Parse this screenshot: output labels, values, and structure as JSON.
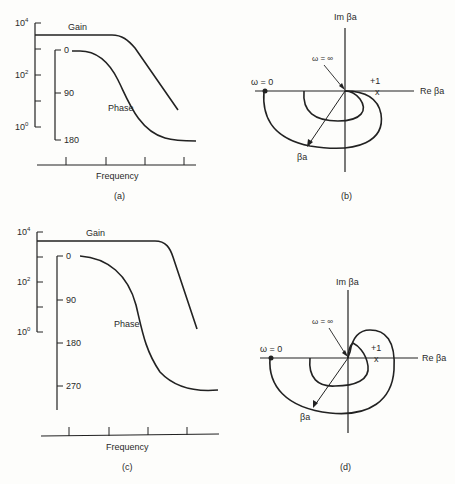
{
  "panels": [
    {
      "id": "a",
      "caption": "(a)",
      "type": "bode",
      "gain_axis": {
        "ticks": [
          "10^4",
          "10^2",
          "10^0"
        ],
        "base": "10",
        "exps": [
          "4",
          "2",
          "0"
        ]
      },
      "phase_axis": {
        "ticks": [
          "0",
          "90",
          "180"
        ]
      },
      "gain_label": "Gain",
      "phase_label": "Phase",
      "xlabel": "Frequency"
    },
    {
      "id": "b",
      "caption": "(b)",
      "type": "nyquist",
      "im_label": "Im βa",
      "re_label": "Re βa",
      "omega_zero": "ω = 0",
      "omega_inf": "ω = ∞",
      "plus_one": "+1",
      "critical_marker": "x",
      "vector_label": "βa"
    },
    {
      "id": "c",
      "caption": "(c)",
      "type": "bode",
      "gain_axis": {
        "ticks": [
          "10^4",
          "10^2",
          "10^0"
        ],
        "base": "10",
        "exps": [
          "4",
          "2",
          "0"
        ]
      },
      "phase_axis": {
        "ticks": [
          "0",
          "90",
          "180",
          "270"
        ]
      },
      "gain_label": "Gain",
      "phase_label": "Phase",
      "xlabel": "Frequency"
    },
    {
      "id": "d",
      "caption": "(d)",
      "type": "nyquist",
      "im_label": "Im βa",
      "re_label": "Re βa",
      "omega_zero": "ω = 0",
      "omega_inf": "ω = ∞",
      "plus_one": "+1",
      "critical_marker": "x",
      "vector_label": "βa"
    }
  ]
}
